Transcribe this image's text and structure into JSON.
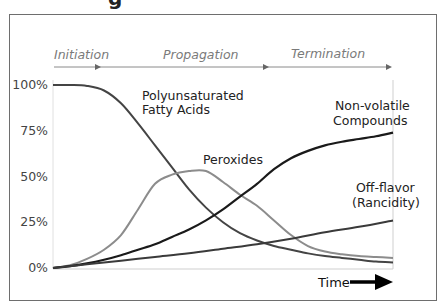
{
  "title_fragment": "g",
  "phases": [
    {
      "label": "Initiation",
      "x_start": 0,
      "x_end": 0.23
    },
    {
      "label": "Propagation",
      "x_start": 0.23,
      "x_end": 0.63
    },
    {
      "label": "Termination",
      "x_start": 0.63,
      "x_end": 1.0
    }
  ],
  "time_label": "Time",
  "chart_data": {
    "type": "line",
    "title": "",
    "xlabel": "Time",
    "ylabel": "",
    "yticks": [
      "0%",
      "25%",
      "50%",
      "75%",
      "100%"
    ],
    "ylim": [
      0,
      100
    ],
    "xlim": [
      0,
      100
    ],
    "grid": false,
    "legend": "inline labels",
    "series": [
      {
        "name": "Polyunsaturated Fatty Acids",
        "color": "#444444",
        "x": [
          0,
          5,
          10,
          15,
          20,
          25,
          30,
          35,
          40,
          45,
          50,
          55,
          60,
          65,
          70,
          75,
          80,
          85,
          90,
          95,
          100
        ],
        "y": [
          100,
          100,
          99.5,
          97,
          90,
          79,
          67,
          55,
          43,
          33,
          25,
          19,
          15,
          12,
          10,
          8,
          6.5,
          5.5,
          4.5,
          3.5,
          3
        ]
      },
      {
        "name": "Peroxides",
        "color": "#8c8c8c",
        "x": [
          0,
          5,
          10,
          15,
          20,
          25,
          30,
          35,
          40,
          45,
          50,
          55,
          60,
          65,
          70,
          75,
          80,
          85,
          90,
          95,
          100
        ],
        "y": [
          0,
          1.5,
          5,
          10,
          18,
          32,
          46,
          51,
          53,
          53,
          47,
          40,
          34,
          26,
          18,
          12,
          9,
          7.5,
          6.5,
          6,
          5.5
        ]
      },
      {
        "name": "Non-volatile Compounds",
        "color": "#1a1a1a",
        "x": [
          0,
          5,
          10,
          15,
          20,
          25,
          30,
          35,
          40,
          45,
          50,
          55,
          60,
          65,
          70,
          75,
          80,
          85,
          90,
          95,
          100
        ],
        "y": [
          0,
          1,
          2.5,
          4.5,
          7,
          10,
          13,
          17,
          21,
          26,
          32,
          39,
          46,
          54,
          60,
          64,
          67,
          69,
          70.5,
          72,
          74
        ]
      },
      {
        "name": "Off-flavor (Rancidity)",
        "color": "#3a3a3a",
        "x": [
          0,
          10,
          20,
          30,
          40,
          50,
          60,
          70,
          80,
          90,
          100
        ],
        "y": [
          0,
          2,
          4,
          6,
          8,
          10.5,
          13,
          16,
          19.5,
          22.5,
          26
        ]
      }
    ],
    "annotations": [
      {
        "text": "Polyunsaturated",
        "line": 1,
        "series": "Polyunsaturated Fatty Acids"
      },
      {
        "text": "Fatty Acids",
        "line": 2,
        "series": "Polyunsaturated Fatty Acids"
      },
      {
        "text": "Peroxides",
        "series": "Peroxides"
      },
      {
        "text": "Non-volatile",
        "line": 1,
        "series": "Non-volatile Compounds"
      },
      {
        "text": "Compounds",
        "line": 2,
        "series": "Non-volatile Compounds"
      },
      {
        "text": "Off-flavor",
        "line": 1,
        "series": "Off-flavor (Rancidity)"
      },
      {
        "text": "(Rancidity)",
        "line": 2,
        "series": "Off-flavor (Rancidity)"
      }
    ]
  }
}
